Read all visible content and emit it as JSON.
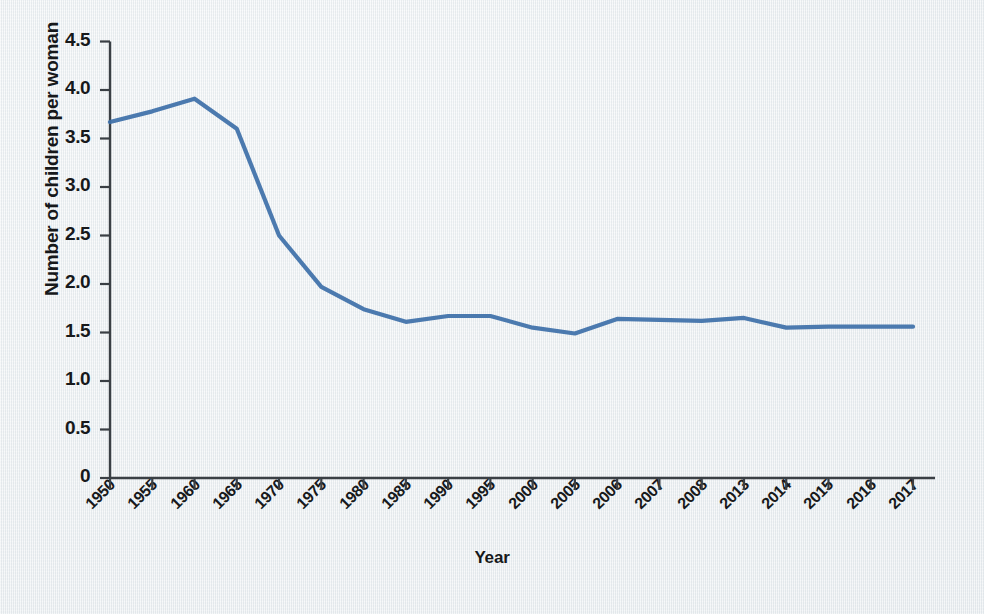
{
  "chart_data": {
    "type": "line",
    "title": "",
    "xlabel": "Year",
    "ylabel": "Number of children per woman",
    "categories": [
      "1950",
      "1955",
      "1960",
      "1965",
      "1970",
      "1975",
      "1980",
      "1985",
      "1990",
      "1995",
      "2000",
      "2005",
      "2006",
      "2007",
      "2008",
      "2013",
      "2014",
      "2015",
      "2016",
      "2017"
    ],
    "values": [
      3.67,
      3.78,
      3.91,
      3.6,
      2.5,
      1.97,
      1.74,
      1.61,
      1.67,
      1.67,
      1.55,
      1.49,
      1.64,
      1.63,
      1.62,
      1.65,
      1.55,
      1.56,
      1.56,
      1.56
    ],
    "series": [
      {
        "name": "Number of children per woman",
        "values": [
          3.67,
          3.78,
          3.91,
          3.6,
          2.5,
          1.97,
          1.74,
          1.61,
          1.67,
          1.67,
          1.55,
          1.49,
          1.64,
          1.63,
          1.62,
          1.65,
          1.55,
          1.56,
          1.56,
          1.56
        ]
      }
    ],
    "ytick_labels": [
      "4.5",
      "4.0",
      "3.5",
      "3.0",
      "2.5",
      "2.0",
      "1.5",
      "1.0",
      "0.5",
      "0"
    ],
    "ytick_values": [
      4.5,
      4.0,
      3.5,
      3.0,
      2.5,
      2.0,
      1.5,
      1.0,
      0.5,
      0
    ],
    "ylim": [
      0,
      4.5
    ],
    "grid": false,
    "legend": "none",
    "line_color": "#3d6fa8",
    "axis_color": "#3a3f44",
    "background_color": "#eef1f3"
  }
}
